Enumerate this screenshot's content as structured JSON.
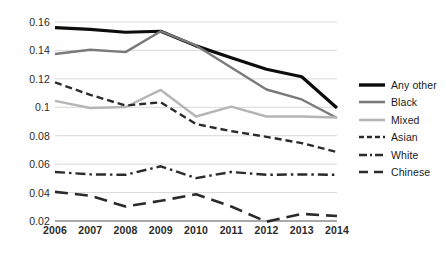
{
  "chart_data": {
    "type": "line",
    "title": "",
    "subtitle": "",
    "xlabel": "",
    "ylabel": "",
    "categories": [
      "2006",
      "2007",
      "2008",
      "2009",
      "2010",
      "2011",
      "2012",
      "2013",
      "2014"
    ],
    "x": [
      2006,
      2007,
      2008,
      2009,
      2010,
      2011,
      2012,
      2013,
      2014
    ],
    "ylim": [
      0.02,
      0.16
    ],
    "xlim": [
      2006,
      2014
    ],
    "y_ticks": [
      0.02,
      0.04,
      0.06,
      0.08,
      0.1,
      0.12,
      0.14,
      0.16
    ],
    "y_tick_labels": [
      "0.02",
      "0.04",
      "0.06",
      "0.08",
      "0.1",
      "0.12",
      "0.14",
      "0.16"
    ],
    "x_tick_labels": [
      "2006",
      "2007",
      "2008",
      "2009",
      "2010",
      "2011",
      "2012",
      "2013",
      "2014"
    ],
    "grid": "horizontal",
    "legend_position": "right",
    "series": [
      {
        "name": "Any other",
        "style": "solid",
        "color": "#0d0d0d",
        "width": 3.2,
        "dash": "",
        "values": [
          0.156,
          0.1548,
          0.1528,
          0.1535,
          0.1432,
          0.1348,
          0.1268,
          0.1215,
          0.0995
        ]
      },
      {
        "name": "Black",
        "style": "solid",
        "color": "#7a7a7a",
        "width": 2.4,
        "dash": "",
        "values": [
          0.1375,
          0.1405,
          0.1388,
          0.1535,
          0.1435,
          0.128,
          0.1125,
          0.1055,
          0.0925
        ]
      },
      {
        "name": "Mixed",
        "style": "solid",
        "color": "#b5b5b5",
        "width": 2.4,
        "dash": "",
        "values": [
          0.1045,
          0.0995,
          0.1002,
          0.1122,
          0.0935,
          0.1005,
          0.0935,
          0.0935,
          0.0928
        ]
      },
      {
        "name": "Asian",
        "style": "dashed",
        "color": "#2b2b2b",
        "width": 2.4,
        "dash": "7,4",
        "values": [
          0.1175,
          0.1088,
          0.1012,
          0.1035,
          0.0882,
          0.0832,
          0.0792,
          0.0748,
          0.0685
        ]
      },
      {
        "name": "White",
        "style": "dash-dot",
        "color": "#2b2b2b",
        "width": 2.4,
        "dash": "10,4,2.5,4",
        "values": [
          0.0545,
          0.0528,
          0.0525,
          0.0585,
          0.0502,
          0.0545,
          0.0525,
          0.0528,
          0.0525
        ]
      },
      {
        "name": "Chinese",
        "style": "long-dash",
        "color": "#2b2b2b",
        "width": 2.6,
        "dash": "13,7",
        "values": [
          0.0405,
          0.0378,
          0.0302,
          0.0342,
          0.0388,
          0.0302,
          0.0195,
          0.025,
          0.0235
        ]
      }
    ],
    "legend": [
      {
        "label": "Any other",
        "color": "#0d0d0d",
        "dash": "",
        "width": 3.4
      },
      {
        "label": "Black",
        "color": "#7a7a7a",
        "dash": "",
        "width": 2.6
      },
      {
        "label": "Mixed",
        "color": "#b5b5b5",
        "dash": "",
        "width": 2.6
      },
      {
        "label": "Asian",
        "color": "#2b2b2b",
        "dash": "5,3",
        "width": 2.4
      },
      {
        "label": "White",
        "color": "#2b2b2b",
        "dash": "8,3,2,3",
        "width": 2.4
      },
      {
        "label": "Chinese",
        "color": "#2b2b2b",
        "dash": "9,6",
        "width": 2.6
      }
    ]
  },
  "colors": {
    "background": "#ffffff",
    "gridline": "#d9d9d9",
    "axis": "#8c8c8c",
    "tick_text": "#2b2b2b"
  }
}
